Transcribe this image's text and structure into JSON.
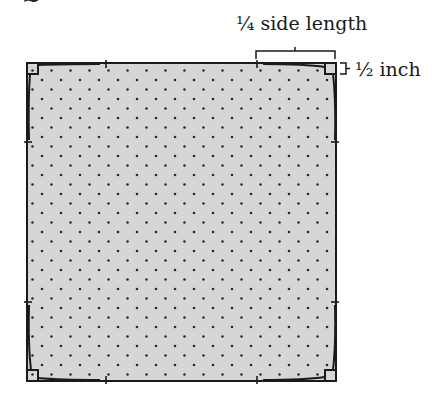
{
  "header_fragment": "...",
  "labels": {
    "quarter_side": "¼ side length",
    "half_inch": "½ inch"
  },
  "colors": {
    "fill": "#d6d6d6",
    "stroke": "#1a1a1a",
    "dots": "#2a2a2a"
  }
}
